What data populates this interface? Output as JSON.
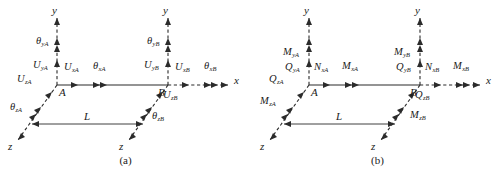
{
  "figure": {
    "colors": {
      "ink": "#1a1a1a",
      "line": "#2b2b2b",
      "background": "#ffffff"
    }
  },
  "panels": [
    {
      "id": "a",
      "caption": "(a)",
      "axes": {
        "x": "x",
        "y_left": "y",
        "y_right": "y",
        "z_left": "z",
        "z_right": "z"
      },
      "nodes": {
        "left": "A",
        "right": "B"
      },
      "length_label": "L",
      "labels": [
        {
          "name": "theta-y-A",
          "main": "θ",
          "sub": "yA",
          "x": 36,
          "y": 44
        },
        {
          "name": "U-y-A",
          "main": "U",
          "sub": "yA",
          "x": 33,
          "y": 68
        },
        {
          "name": "U-x-A",
          "main": "U",
          "sub": "xA",
          "x": 64,
          "y": 70
        },
        {
          "name": "theta-x-A",
          "main": "θ",
          "sub": "xA",
          "x": 93,
          "y": 69
        },
        {
          "name": "U-z-A",
          "main": "U",
          "sub": "zA",
          "x": 17,
          "y": 82
        },
        {
          "name": "theta-z-A",
          "main": "θ",
          "sub": "zA",
          "x": 10,
          "y": 110
        },
        {
          "name": "theta-y-B",
          "main": "θ",
          "sub": "yB",
          "x": 147,
          "y": 44
        },
        {
          "name": "U-y-B",
          "main": "U",
          "sub": "yB",
          "x": 144,
          "y": 68
        },
        {
          "name": "U-x-B",
          "main": "U",
          "sub": "xB",
          "x": 175,
          "y": 70
        },
        {
          "name": "theta-x-B",
          "main": "θ",
          "sub": "xB",
          "x": 204,
          "y": 69
        },
        {
          "name": "U-z-B",
          "main": "U",
          "sub": "zB",
          "x": 163,
          "y": 98
        },
        {
          "name": "theta-z-B",
          "main": "θ",
          "sub": "zB",
          "x": 152,
          "y": 119
        }
      ]
    },
    {
      "id": "b",
      "caption": "(b)",
      "axes": {
        "x": "x",
        "y_left": "y",
        "y_right": "y",
        "z_left": "z",
        "z_right": "z"
      },
      "nodes": {
        "left": "A",
        "right": "B"
      },
      "length_label": "L",
      "labels": [
        {
          "name": "M-y-A",
          "main": "M",
          "sub": "yA",
          "x": 31,
          "y": 55
        },
        {
          "name": "Q-y-A",
          "main": "Q",
          "sub": "yA",
          "x": 33,
          "y": 70
        },
        {
          "name": "N-x-A",
          "main": "N",
          "sub": "xA",
          "x": 62,
          "y": 70
        },
        {
          "name": "M-x-A",
          "main": "M",
          "sub": "xA",
          "x": 90,
          "y": 69
        },
        {
          "name": "Q-z-A",
          "main": "Q",
          "sub": "zA",
          "x": 17,
          "y": 82
        },
        {
          "name": "M-z-A",
          "main": "M",
          "sub": "zA",
          "x": 8,
          "y": 104
        },
        {
          "name": "M-y-B",
          "main": "M",
          "sub": "yB",
          "x": 142,
          "y": 55
        },
        {
          "name": "Q-y-B",
          "main": "Q",
          "sub": "yB",
          "x": 144,
          "y": 70
        },
        {
          "name": "N-x-B",
          "main": "N",
          "sub": "xB",
          "x": 173,
          "y": 70
        },
        {
          "name": "M-x-B",
          "main": "M",
          "sub": "xB",
          "x": 201,
          "y": 69
        },
        {
          "name": "Q-z-B",
          "main": "Q",
          "sub": "zB",
          "x": 163,
          "y": 98
        },
        {
          "name": "M-z-B",
          "main": "M",
          "sub": "zB",
          "x": 158,
          "y": 118
        }
      ]
    }
  ]
}
